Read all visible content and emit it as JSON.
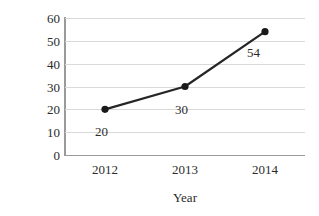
{
  "chart_data": {
    "type": "line",
    "title": "",
    "xlabel": "Year",
    "ylabel": "Population",
    "categories": [
      "2012",
      "2013",
      "2014"
    ],
    "values": [
      20,
      30,
      54
    ],
    "point_labels": [
      "20",
      "30",
      "54"
    ],
    "ylim": [
      0,
      60
    ],
    "y_ticks": [
      "0",
      "10",
      "20",
      "30",
      "40",
      "50",
      "60"
    ],
    "y_tick_values": [
      0,
      10,
      20,
      30,
      40,
      50,
      60
    ],
    "grid": "horizontal",
    "legend": "none",
    "series": [
      {
        "name": "Population",
        "values": [
          20,
          30,
          54
        ],
        "color": "#262626",
        "marker": "circle",
        "marker_color": "#1a1a1a"
      }
    ],
    "axis_color": "#9a9a9a",
    "gridline_color": "#d9d9d9",
    "background": "#ffffff"
  }
}
